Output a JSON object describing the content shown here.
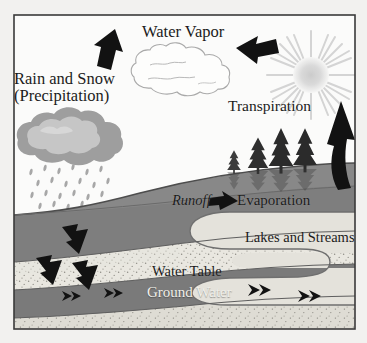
{
  "diagram": {
    "labels": {
      "water_vapor": "Water Vapor",
      "rain_snow_line1": "Rain and Snow",
      "rain_snow_line2": "(Precipitation)",
      "transpiration": "Transpiration",
      "runoff": "Runoff",
      "evaporation": "Evaporation",
      "lakes_and_streams": "Lakes and Streams",
      "water_table": "Water Table",
      "ground_water": "Ground Water"
    },
    "icons": {
      "sun": "sun-icon",
      "vapor_cloud": "cloud-outline-icon",
      "rain_cloud": "rain-cloud-icon",
      "rain_drops": "raindrops-icon",
      "trees": "conifer-trees-icon",
      "arrow_precipitation": "arrow-down-left-icon",
      "arrow_condensation": "arrow-left-icon",
      "arrow_transpiration": "arrow-up-curved-icon",
      "arrow_runoff": "arrow-right-icon",
      "arrow_infiltration": "arrow-down-icon",
      "arrow_groundwater_flow": "double-chevron-right-icon",
      "frame": "diagram-border"
    },
    "colors": {
      "background": "#f2f1ef",
      "border": "#3a3a3a",
      "sky": "#fbfbfa",
      "soil_dark": "#7d7d7d",
      "soil_mid": "#8f8f8f",
      "aquifer_light": "#e9e7e0",
      "water_light": "#dedcd4",
      "cloud_gray": "#b9b9b9",
      "cloud_gray_light": "#cdcdcd",
      "sun_gray": "#d6d6d6",
      "arrow_black": "#121212",
      "text_dark": "#1b1b1b",
      "text_light": "#f0efe9"
    }
  }
}
